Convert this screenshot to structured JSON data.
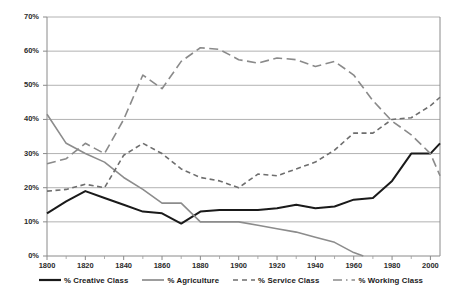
{
  "chart_data": {
    "type": "line",
    "title": "",
    "subtitle": "",
    "xlabel": "",
    "ylabel": "",
    "xlim": [
      1800,
      2005
    ],
    "ylim": [
      0,
      70
    ],
    "grid": "horizontal",
    "legend_position": "bottom",
    "x_tick_labels": [
      "1800",
      "1820",
      "1840",
      "1860",
      "1880",
      "1900",
      "1920",
      "1940",
      "1960",
      "1980",
      "2000"
    ],
    "x_tick_values": [
      1800,
      1820,
      1840,
      1860,
      1880,
      1900,
      1920,
      1940,
      1960,
      1980,
      2000
    ],
    "x_minor_tick_values": [
      1810,
      1830,
      1850,
      1870,
      1890,
      1910,
      1930,
      1950,
      1970,
      1990
    ],
    "y_tick_labels": [
      "0%",
      "10%",
      "20%",
      "30%",
      "40%",
      "50%",
      "60%",
      "70%"
    ],
    "y_tick_values": [
      0,
      10,
      20,
      30,
      40,
      50,
      60,
      70
    ],
    "series": [
      {
        "name": "% Creative Class",
        "legend_label": "% Creative Class",
        "color": "#1a1a1a",
        "style": "solid",
        "width": 2.0,
        "x": [
          1800,
          1810,
          1820,
          1830,
          1840,
          1850,
          1860,
          1870,
          1880,
          1890,
          1900,
          1910,
          1920,
          1930,
          1940,
          1950,
          1960,
          1970,
          1980,
          1990,
          2000,
          2005
        ],
        "values": [
          12.5,
          16.0,
          19.0,
          17.0,
          15.0,
          13.0,
          12.5,
          9.5,
          13.0,
          13.5,
          13.5,
          13.5,
          14.0,
          15.0,
          14.0,
          14.5,
          16.5,
          17.0,
          22.0,
          30.0,
          30.0,
          33.0
        ]
      },
      {
        "name": "% Agriculture",
        "legend_label": "% Agriculture",
        "color": "#8c8c8c",
        "style": "solid",
        "width": 1.6,
        "x": [
          1800,
          1810,
          1820,
          1830,
          1840,
          1850,
          1860,
          1870,
          1880,
          1890,
          1900,
          1910,
          1920,
          1930,
          1940,
          1950,
          1960,
          1965
        ],
        "values": [
          41.5,
          33.0,
          30.0,
          27.5,
          23.0,
          19.5,
          15.5,
          15.5,
          10.0,
          10.0,
          10.0,
          9.0,
          8.0,
          7.0,
          5.5,
          4.0,
          1.0,
          0.0
        ]
      },
      {
        "name": "% Service Class",
        "legend_label": "% Service Class",
        "color": "#6e6e6e",
        "style": "dashed-short",
        "width": 1.6,
        "x": [
          1800,
          1810,
          1820,
          1830,
          1840,
          1850,
          1860,
          1870,
          1880,
          1890,
          1900,
          1910,
          1920,
          1930,
          1940,
          1950,
          1960,
          1970,
          1980,
          1990,
          2000,
          2005
        ],
        "values": [
          19.0,
          19.5,
          21.0,
          20.0,
          29.5,
          33.0,
          30.0,
          25.5,
          23.0,
          22.0,
          20.0,
          24.0,
          23.5,
          25.5,
          27.5,
          31.0,
          36.0,
          36.0,
          40.0,
          40.5,
          44.0,
          46.5
        ]
      },
      {
        "name": "% Working Class",
        "legend_label": "% Working Class",
        "color": "#8a8a8a",
        "style": "dashed-long",
        "width": 1.6,
        "x": [
          1800,
          1810,
          1820,
          1830,
          1840,
          1850,
          1860,
          1870,
          1880,
          1890,
          1900,
          1910,
          1920,
          1930,
          1940,
          1950,
          1960,
          1970,
          1980,
          1990,
          2000,
          2005
        ],
        "values": [
          27.0,
          28.5,
          33.0,
          30.0,
          40.0,
          53.0,
          49.0,
          57.0,
          61.0,
          60.5,
          57.5,
          56.5,
          58.0,
          57.5,
          55.5,
          57.0,
          53.0,
          45.5,
          39.5,
          35.5,
          30.0,
          23.5
        ]
      }
    ]
  }
}
